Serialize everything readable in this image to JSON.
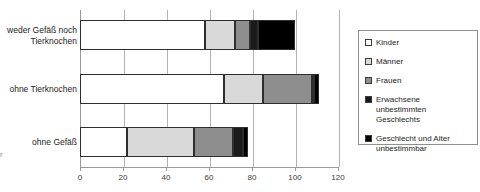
{
  "chart_data": {
    "type": "bar",
    "orientation": "horizontal",
    "stacked": true,
    "title": "",
    "xlabel": "",
    "ylabel": "",
    "xlim": [
      0,
      120
    ],
    "xticks": [
      0,
      20,
      40,
      60,
      80,
      100,
      120
    ],
    "xtick_labels": [
      "0",
      "20",
      "40",
      "60",
      "80",
      "100",
      "120"
    ],
    "grid": true,
    "grid_axis": "x",
    "legend_position": "right",
    "categories": [
      "weder Gefäß noch Tierknochen",
      "ohne Tierknochen",
      "ohne Gefäß"
    ],
    "category_lines": [
      [
        "weder Gefäß noch",
        "Tierknochen"
      ],
      [
        "ohne Tierknochen"
      ],
      [
        "ohne Gefäß"
      ]
    ],
    "series": [
      {
        "name": "Kinder",
        "color": "#ffffff",
        "values": [
          58,
          67,
          22
        ]
      },
      {
        "name": "Männer",
        "color": "#d9d9d9",
        "values": [
          14,
          18,
          31
        ]
      },
      {
        "name": "Frauen",
        "color": "#8e8e8e",
        "values": [
          7,
          23,
          18
        ]
      },
      {
        "name": "Erwachsene unbestimmten Geschlechts",
        "color": "#1a1a1a",
        "values": [
          4,
          1,
          5
        ]
      },
      {
        "name": "Geschlecht und Alter unbestimmbar",
        "color": "#000000",
        "values": [
          17,
          2,
          2
        ]
      }
    ],
    "totals": [
      100,
      111,
      78
    ]
  },
  "axis_title_fragment": "r",
  "legend": {
    "items": [
      {
        "label": "Kinder",
        "swatch": "c0"
      },
      {
        "label": "Männer",
        "swatch": "c1"
      },
      {
        "label": "Frauen",
        "swatch": "c2"
      },
      {
        "label": "Erwachsene unbestimmten Geschlechts",
        "swatch": "c3"
      },
      {
        "label": "Geschlecht und Alter unbestimmbar",
        "swatch": "c4"
      }
    ]
  }
}
